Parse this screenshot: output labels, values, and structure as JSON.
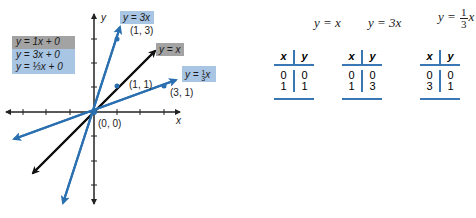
{
  "graph": {
    "axis_labels": {
      "x": "x",
      "y": "y"
    },
    "origin_label": "(0, 0)",
    "lines": [
      {
        "equation": "y = 3x",
        "point_label": "(1, 3)",
        "color": "#2a6fb0",
        "slope": 3
      },
      {
        "equation": "y = x",
        "point_label": "(1, 1)",
        "color": "#111111",
        "slope": 1
      },
      {
        "equation": "y = 1/3 x",
        "point_label": "(3, 1)",
        "color": "#2a6fb0",
        "slope": 0.3333
      }
    ],
    "legend": [
      {
        "text": "y = 1x + 0",
        "bg": "#a3a3a3"
      },
      {
        "text": "y = 3x + 0",
        "bg": "#a8c5e3"
      },
      {
        "text": "y = ⅓x + 0",
        "bg": "#a8c5e3"
      }
    ]
  },
  "tables": [
    {
      "equation_lhs": "y =",
      "equation_rhs": "x",
      "headers": [
        "x",
        "y"
      ],
      "rows": [
        [
          "0",
          "0"
        ],
        [
          "1",
          "1"
        ]
      ]
    },
    {
      "equation_lhs": "y =",
      "equation_rhs": "3x",
      "headers": [
        "x",
        "y"
      ],
      "rows": [
        [
          "0",
          "0"
        ],
        [
          "1",
          "3"
        ]
      ]
    },
    {
      "equation_lhs": "y =",
      "frac_num": "1",
      "frac_den": "3",
      "equation_rhs": "x",
      "headers": [
        "x",
        "y"
      ],
      "rows": [
        [
          "0",
          "0"
        ],
        [
          "3",
          "1"
        ]
      ]
    }
  ],
  "colors": {
    "accent_blue": "#2a6fb0",
    "table_rule": "#3a78b5",
    "label_blue_bg": "#a8c5e3",
    "label_gray_bg": "#a3a3a3"
  }
}
